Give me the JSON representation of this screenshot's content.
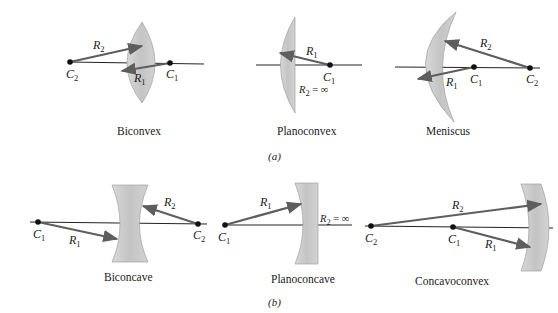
{
  "figure": {
    "part_a": {
      "label": "(a)",
      "lenses": [
        {
          "name": "Biconvex",
          "centers": [
            "C2",
            "C1"
          ],
          "radii": [
            "R2",
            "R1"
          ]
        },
        {
          "name": "Planoconvex",
          "centers": [
            "C1"
          ],
          "radii": [
            "R1"
          ],
          "note": "R2 = ∞"
        },
        {
          "name": "Meniscus",
          "centers": [
            "C1",
            "C2"
          ],
          "radii": [
            "R1",
            "R2"
          ]
        }
      ]
    },
    "part_b": {
      "label": "(b)",
      "lenses": [
        {
          "name": "Biconcave",
          "centers": [
            "C1",
            "C2"
          ],
          "radii": [
            "R1",
            "R2"
          ]
        },
        {
          "name": "Planoconcave",
          "centers": [
            "C1"
          ],
          "radii": [
            "R1"
          ],
          "note": "R2 = ∞"
        },
        {
          "name": "Concavoconvex",
          "centers": [
            "C2",
            "C1"
          ],
          "radii": [
            "R2",
            "R1"
          ]
        }
      ]
    },
    "text": {
      "R": "R",
      "C": "C",
      "s1": "1",
      "s2": "2",
      "inf": " = ∞"
    },
    "colors": {
      "lens_fill": "#c9c9c9",
      "lens_edge": "#9a9a9a",
      "arrow": "#5e5e5e",
      "axis": "#222222"
    }
  }
}
